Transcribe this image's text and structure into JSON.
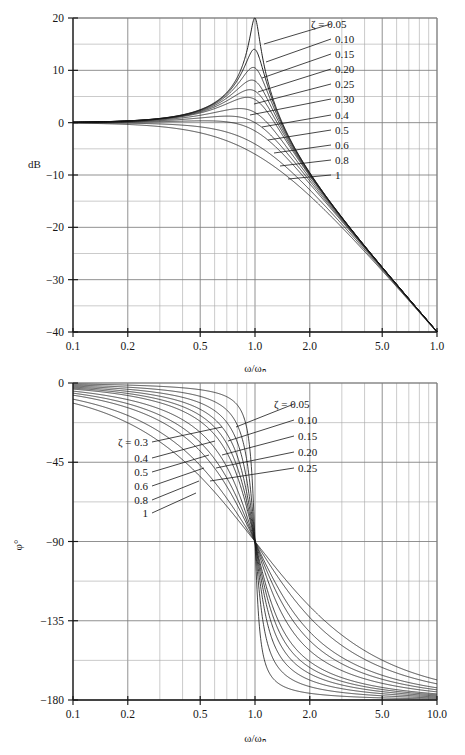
{
  "figure": {
    "ink_color": "#171717",
    "grid_color": "#7d7d7d",
    "minor_grid_color": "#a8a8a8",
    "background": "#ffffff"
  },
  "chart_data": [
    {
      "id": "magnitude",
      "type": "line",
      "title": "",
      "xlabel": "ω/ωₙ",
      "ylabel": "dB",
      "xscale": "log",
      "xlim": [
        0.1,
        10
      ],
      "ylim": [
        -40,
        20
      ],
      "grid": true,
      "y_major_ticks": [
        20,
        10,
        0,
        -10,
        -20,
        -30,
        -40
      ],
      "y_major_tick_labels": [
        "20",
        "10",
        "0",
        "-10",
        "-20",
        "-30",
        "-40"
      ],
      "y_minor_step": 5,
      "x_tick_labels": [
        "0.1",
        "0.2",
        "0.5",
        "1.0",
        "2.0",
        "5.0",
        "1.0"
      ],
      "x_tick_values": [
        0.1,
        0.2,
        0.5,
        1.0,
        2.0,
        5.0,
        10.0
      ],
      "legend_position": "inside-right",
      "legend_prefix": "ζ = ",
      "series": [
        {
          "name": "0.05",
          "zeta": 0.05,
          "label": "0.05",
          "label_with_prefix": true
        },
        {
          "name": "0.10",
          "zeta": 0.1,
          "label": "0.10",
          "label_with_prefix": false
        },
        {
          "name": "0.15",
          "zeta": 0.15,
          "label": "0.15",
          "label_with_prefix": false
        },
        {
          "name": "0.20",
          "zeta": 0.2,
          "label": "0.20",
          "label_with_prefix": false
        },
        {
          "name": "0.25",
          "zeta": 0.25,
          "label": "0.25",
          "label_with_prefix": false
        },
        {
          "name": "0.30",
          "zeta": 0.3,
          "label": "0.30",
          "label_with_prefix": false
        },
        {
          "name": "0.4",
          "zeta": 0.4,
          "label": "0.4",
          "label_with_prefix": false
        },
        {
          "name": "0.5",
          "zeta": 0.5,
          "label": "0.5",
          "label_with_prefix": false
        },
        {
          "name": "0.6",
          "zeta": 0.6,
          "label": "0.6",
          "label_with_prefix": false
        },
        {
          "name": "0.8",
          "zeta": 0.8,
          "label": "0.8",
          "label_with_prefix": false
        },
        {
          "name": "1",
          "zeta": 1.0,
          "label": "1",
          "label_with_prefix": false
        }
      ],
      "peak_values_db": {
        "0.05": 20.0,
        "0.10": 14.0,
        "0.15": 10.5,
        "0.20": 8.1,
        "0.25": 6.3,
        "0.30": 4.8,
        "0.4": 2.7,
        "0.5": 1.2,
        "0.6": 0.3,
        "0.8": 0.0,
        "1": 0.0
      },
      "value_at_wn_db": {
        "0.05": 20.0,
        "0.10": 14.0,
        "0.15": 10.5,
        "0.20": 8.0,
        "0.25": 6.0,
        "0.30": 4.4,
        "0.4": 1.9,
        "0.5": 0.0,
        "0.6": -1.6,
        "0.8": -4.1,
        "1": -6.0
      },
      "asymptote_slope_db_per_decade": -40
    },
    {
      "id": "phase",
      "type": "line",
      "title": "",
      "xlabel": "ω/ωₙ",
      "ylabel": "φ°",
      "xscale": "log",
      "xlim": [
        0.1,
        10
      ],
      "ylim": [
        -180,
        0
      ],
      "grid": true,
      "y_major_ticks": [
        0,
        -45,
        -90,
        -135,
        -180
      ],
      "y_major_tick_labels": [
        "0",
        "-45",
        "-90",
        "-135",
        "-180"
      ],
      "y_minor_step": 22.5,
      "x_tick_labels": [
        "0.1",
        "0.2",
        "0.5",
        "1.0",
        "2.0",
        "5.0",
        "10.0"
      ],
      "x_tick_values": [
        0.1,
        0.2,
        0.5,
        1.0,
        2.0,
        5.0,
        10.0
      ],
      "legend_prefix": "ζ = ",
      "series": [
        {
          "name": "0.05",
          "zeta": 0.05,
          "label": "0.05",
          "group": "right"
        },
        {
          "name": "0.10",
          "zeta": 0.1,
          "label": "0.10",
          "group": "right"
        },
        {
          "name": "0.15",
          "zeta": 0.15,
          "label": "0.15",
          "group": "right"
        },
        {
          "name": "0.20",
          "zeta": 0.2,
          "label": "0.20",
          "group": "right"
        },
        {
          "name": "0.25",
          "zeta": 0.25,
          "label": "0.25",
          "group": "right"
        },
        {
          "name": "0.3",
          "zeta": 0.3,
          "label": "0.3",
          "group": "left"
        },
        {
          "name": "0.4",
          "zeta": 0.4,
          "label": "0.4",
          "group": "left"
        },
        {
          "name": "0.5",
          "zeta": 0.5,
          "label": "0.5",
          "group": "left"
        },
        {
          "name": "0.6",
          "zeta": 0.6,
          "label": "0.6",
          "group": "left"
        },
        {
          "name": "0.8",
          "zeta": 0.8,
          "label": "0.8",
          "group": "left"
        },
        {
          "name": "1",
          "zeta": 1.0,
          "label": "1",
          "group": "left"
        }
      ],
      "value_at_wn_deg": -90,
      "asymptote_low_deg": 0,
      "asymptote_high_deg": -180
    }
  ],
  "magnitude_legend": {
    "prefix": "ζ = ",
    "entries": [
      "0.05",
      "0.10",
      "0.15",
      "0.20",
      "0.25",
      "0.30",
      "0.4",
      "0.5",
      "0.6",
      "0.8",
      "1"
    ]
  },
  "phase_legend_right": {
    "prefix": "ζ = ",
    "entries": [
      "0.05",
      "0.10",
      "0.15",
      "0.20",
      "0.25"
    ]
  },
  "phase_legend_left": {
    "prefix": "ζ = ",
    "entries": [
      "0.3",
      "0.4",
      "0.5",
      "0.6",
      "0.8",
      "1"
    ]
  }
}
